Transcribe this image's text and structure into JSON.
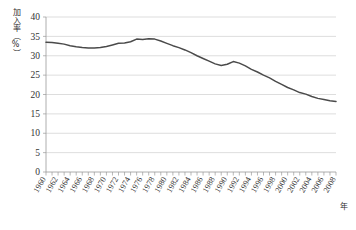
{
  "chart_data": {
    "type": "line",
    "title": "",
    "subtitle": "",
    "ylabel": "加入率（%）",
    "xlabel": "年",
    "ylim": [
      0,
      40
    ],
    "ytick_step": 5,
    "yticks": [
      "0",
      "5",
      "10",
      "15",
      "20",
      "25",
      "30",
      "35",
      "40"
    ],
    "xlim": [
      1960,
      2008
    ],
    "xtick_step": 2,
    "grid": "horizontal",
    "legend": "none",
    "line_color": "#4a4a4a",
    "grid_color": "#cfcfcf",
    "axis_color": "#9a9a9a",
    "categories": [
      "1960",
      "1961",
      "1962",
      "1963",
      "1964",
      "1965",
      "1966",
      "1967",
      "1968",
      "1969",
      "1970",
      "1971",
      "1972",
      "1973",
      "1974",
      "1975",
      "1976",
      "1977",
      "1978",
      "1979",
      "1980",
      "1981",
      "1982",
      "1983",
      "1984",
      "1985",
      "1986",
      "1987",
      "1988",
      "1989",
      "1990",
      "1991",
      "1992",
      "1993",
      "1994",
      "1995",
      "1996",
      "1997",
      "1998",
      "1999",
      "2000",
      "2001",
      "2002",
      "2003",
      "2004",
      "2005",
      "2006",
      "2007",
      "2008"
    ],
    "xtick_labels": [
      "1960",
      "1962",
      "1964",
      "1966",
      "1968",
      "1970",
      "1972",
      "1974",
      "1976",
      "1978",
      "1980",
      "1982",
      "1984",
      "1986",
      "1988",
      "1990",
      "1992",
      "1994",
      "1996",
      "1998",
      "2000",
      "2002",
      "2004",
      "2006",
      "2008"
    ],
    "values": [
      33.5,
      33.4,
      33.2,
      33.0,
      32.6,
      32.3,
      32.1,
      32.0,
      32.0,
      32.1,
      32.4,
      32.8,
      33.2,
      33.3,
      33.6,
      34.3,
      34.2,
      34.4,
      34.3,
      33.8,
      33.2,
      32.6,
      32.1,
      31.5,
      30.8,
      30.0,
      29.3,
      28.6,
      27.9,
      27.5,
      27.8,
      28.5,
      28.1,
      27.4,
      26.5,
      25.8,
      25.0,
      24.3,
      23.4,
      22.6,
      21.8,
      21.2,
      20.5,
      20.1,
      19.5,
      19.0,
      18.7,
      18.4,
      18.2
    ]
  },
  "axis": {
    "y_title": "加入率（%）",
    "x_title": "年"
  }
}
